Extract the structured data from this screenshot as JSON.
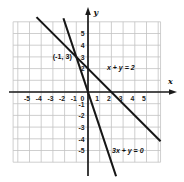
{
  "figure": {
    "background": "#ffffff",
    "grid_color": "#c3c3c3",
    "axis_color": "#1a1a1a",
    "line_color": "#161616",
    "text_color": "#1a1a1a"
  },
  "chart_data": {
    "type": "line",
    "title": "",
    "xlabel": "x",
    "ylabel": "y",
    "xlim": [
      -6.4,
      6.2
    ],
    "ylim": [
      -7.3,
      7.2
    ],
    "grid": true,
    "x_ticks": [
      -5,
      -4,
      -3,
      -2,
      -1,
      0,
      1,
      2,
      3,
      4,
      5
    ],
    "y_ticks": [
      5,
      4,
      3,
      2,
      -1,
      -2,
      -3,
      -4,
      -5
    ],
    "series": [
      {
        "name": "x + y = 2",
        "label": "x + y = 2",
        "slope": -1,
        "y_intercept": 2,
        "x_intercept": 2,
        "draw_from": [
          -4.4,
          6.4
        ],
        "draw_to": [
          6.2,
          -4.2
        ],
        "label_at": [
          2.8,
          2.1
        ]
      },
      {
        "name": "3x + y = 0",
        "label": "3x + y = 0",
        "slope": -3,
        "y_intercept": 0,
        "x_intercept": 0,
        "draw_from": [
          -2.1,
          6.3
        ],
        "draw_to": [
          2.4,
          -7.2
        ],
        "label_at": [
          3.4,
          -5.0
        ]
      }
    ],
    "annotations": [
      {
        "label": "(-1, 3)",
        "at": [
          -2.2,
          3.0
        ],
        "marks_point": [
          -1,
          3
        ]
      }
    ],
    "intersection_point": [
      -1,
      3
    ]
  }
}
